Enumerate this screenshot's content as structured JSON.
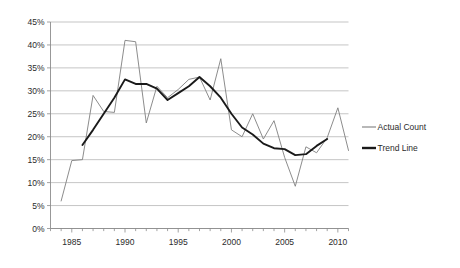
{
  "chart_data": {
    "type": "line",
    "title": "",
    "subtitle": "",
    "xlabel": "",
    "ylabel": "",
    "xlim": [
      1983,
      2011
    ],
    "ylim": [
      0,
      45
    ],
    "ytick_values": [
      0,
      5,
      10,
      15,
      20,
      25,
      30,
      35,
      40,
      45
    ],
    "ytick_labels": [
      "0%",
      "5%",
      "10%",
      "15%",
      "20%",
      "25%",
      "30%",
      "35%",
      "40%",
      "45%"
    ],
    "xtick_labels": [
      "1985",
      "1990",
      "1995",
      "2000",
      "2005",
      "2010"
    ],
    "xtick_values": [
      1985,
      1990,
      1995,
      2000,
      2005,
      2010
    ],
    "xminor_step": 1,
    "grid": "horizontal",
    "legend_position": "right",
    "series": [
      {
        "name": "Actual Count",
        "color": "#7f7f7f",
        "width": 0.9,
        "x": [
          1984,
          1985,
          1986,
          1987,
          1988,
          1989,
          1990,
          1991,
          1992,
          1993,
          1994,
          1995,
          1996,
          1997,
          1998,
          1999,
          2000,
          2001,
          2002,
          2003,
          2004,
          2005,
          2006,
          2007,
          2008,
          2009,
          2010,
          2011
        ],
        "values": [
          6.0,
          14.8,
          15.0,
          29.0,
          25.5,
          25.3,
          41.0,
          40.7,
          23.0,
          31.0,
          28.5,
          30.3,
          32.5,
          33.0,
          28.0,
          37.0,
          21.5,
          20.0,
          25.0,
          19.5,
          23.5,
          15.5,
          9.2,
          17.8,
          16.5,
          19.8,
          26.3,
          17.0
        ]
      },
      {
        "name": "Trend Line",
        "color": "#1a1a1a",
        "width": 1.9,
        "x": [
          1986,
          1987,
          1988,
          1989,
          1990,
          1991,
          1992,
          1993,
          1994,
          1995,
          1996,
          1997,
          1998,
          1999,
          2000,
          2001,
          2002,
          2003,
          2004,
          2005,
          2006,
          2007,
          2008,
          2009
        ],
        "values": [
          18.2,
          21.5,
          25.0,
          28.5,
          32.5,
          31.5,
          31.5,
          30.5,
          28.0,
          29.5,
          31.0,
          33.0,
          31.0,
          28.5,
          25.0,
          22.0,
          20.5,
          18.5,
          17.5,
          17.3,
          16.0,
          16.2,
          18.0,
          19.5
        ]
      }
    ]
  },
  "legend": {
    "items": [
      {
        "label": "Actual Count",
        "color": "#7f7f7f",
        "width": 1.1
      },
      {
        "label": "Trend Line",
        "color": "#1a1a1a",
        "width": 2.4
      }
    ]
  }
}
